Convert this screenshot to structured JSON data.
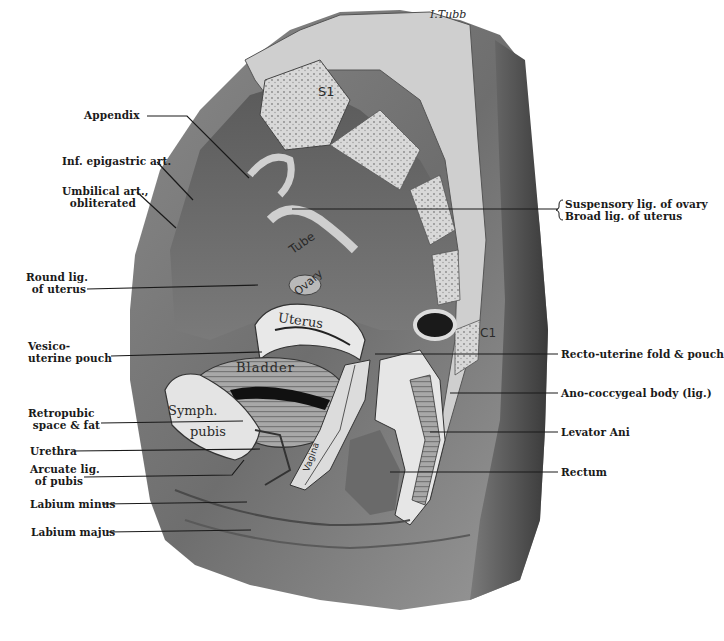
{
  "figure": {
    "type": "anatomical illustration",
    "signature": "I.Tubb"
  },
  "labels_left": [
    {
      "id": "appendix",
      "lines": [
        "Appendix"
      ]
    },
    {
      "id": "inf-epigastric-art",
      "lines": [
        "Inf. epigastric art."
      ]
    },
    {
      "id": "umbilical-art",
      "lines": [
        "Umbilical art.,",
        "obliterated"
      ]
    },
    {
      "id": "round-lig",
      "lines": [
        "Round lig.",
        "of uterus"
      ]
    },
    {
      "id": "vesico-uterine-pouch",
      "lines": [
        "Vesico-",
        "uterine pouch"
      ]
    },
    {
      "id": "retropubic-space",
      "lines": [
        "Retropubic",
        "space & fat"
      ]
    },
    {
      "id": "urethra",
      "lines": [
        "Urethra"
      ]
    },
    {
      "id": "arcuate-lig",
      "lines": [
        "Arcuate lig.",
        "of pubis"
      ]
    },
    {
      "id": "labium-minus",
      "lines": [
        "Labium minus"
      ]
    },
    {
      "id": "labium-majus",
      "lines": [
        "Labium majus"
      ]
    }
  ],
  "labels_right": [
    {
      "id": "suspensory-lig",
      "lines": [
        "Suspensory lig. of ovary"
      ]
    },
    {
      "id": "broad-lig",
      "lines": [
        "Broad lig. of uterus"
      ]
    },
    {
      "id": "recto-uterine",
      "lines": [
        "Recto-uterine fold & pouch"
      ]
    },
    {
      "id": "ano-coccygeal",
      "lines": [
        "Ano-coccygeal body (lig.)"
      ]
    },
    {
      "id": "levator-ani",
      "lines": [
        "Levator Ani"
      ]
    },
    {
      "id": "rectum",
      "lines": [
        "Rectum"
      ]
    }
  ],
  "inline_labels": {
    "s1": "S1",
    "tube": "Tube",
    "ovary": "Ovary",
    "uterus": "Uterus",
    "bladder": "Bladder",
    "symph": "Symph.",
    "pubis": "pubis",
    "c1": "C1",
    "vagina": "Vagina"
  }
}
